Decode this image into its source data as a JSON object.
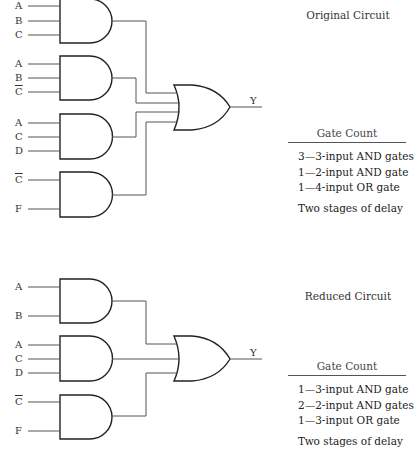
{
  "original": {
    "title": "Original Circuit",
    "and_gates": [
      {
        "inputs": [
          "A",
          "B",
          "C"
        ],
        "complemented": [
          false,
          false,
          false
        ]
      },
      {
        "inputs": [
          "A",
          "B",
          "C"
        ],
        "complemented": [
          false,
          false,
          true
        ]
      },
      {
        "inputs": [
          "A",
          "C",
          "D"
        ],
        "complemented": [
          false,
          false,
          false
        ]
      },
      {
        "inputs": [
          "C",
          "F"
        ],
        "complemented": [
          true,
          false
        ]
      }
    ],
    "or_gate": {
      "inputs": 4,
      "output": "Y"
    },
    "gate_count": {
      "heading": "Gate Count",
      "rows": [
        "3—3-input AND gates",
        "1—2-input AND gate",
        "1—4-input OR gate"
      ],
      "delay": "Two stages of delay"
    }
  },
  "reduced": {
    "title": "Reduced Circuit",
    "and_gates": [
      {
        "inputs": [
          "A",
          "B"
        ],
        "complemented": [
          false,
          false
        ]
      },
      {
        "inputs": [
          "A",
          "C",
          "D"
        ],
        "complemented": [
          false,
          false,
          false
        ]
      },
      {
        "inputs": [
          "C",
          "F"
        ],
        "complemented": [
          true,
          false
        ]
      }
    ],
    "or_gate": {
      "inputs": 3,
      "output": "Y"
    },
    "gate_count": {
      "heading": "Gate Count",
      "rows": [
        "1—3-input AND gate",
        "2—2-input AND gates",
        "1—3-input OR gate"
      ],
      "delay": "Two stages of delay"
    }
  }
}
